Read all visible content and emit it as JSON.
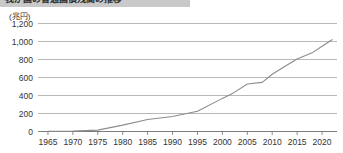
{
  "title": {
    "text": "我が国の普通国債残高の推移"
  },
  "unit": {
    "label": "(兆円)"
  },
  "chart_data": {
    "type": "line",
    "title": "我が国の普通国債残高の推移",
    "xlabel": "",
    "ylabel": "(兆円)",
    "xlim": [
      1963,
      2023
    ],
    "ylim": [
      0,
      1200
    ],
    "grid": true,
    "legend": "none",
    "y_ticks": [
      0,
      200,
      400,
      600,
      800,
      1000,
      1200
    ],
    "y_tick_labels": [
      "0",
      "200",
      "400",
      "600",
      "800",
      "1,000",
      "1,200"
    ],
    "x_ticks": [
      1965,
      1970,
      1975,
      1980,
      1985,
      1990,
      1995,
      2000,
      2005,
      2010,
      2015,
      2020
    ],
    "x_tick_labels": [
      "1965",
      "1970",
      "1975",
      "1980",
      "1985",
      "1990",
      "1995",
      "2000",
      "2005",
      "2010",
      "2015",
      "2020"
    ],
    "series": [
      {
        "name": "普通国債残高",
        "color": "#8c8c8c",
        "x": [
          1965,
          1970,
          1975,
          1980,
          1985,
          1990,
          1995,
          2000,
          2002,
          2005,
          2008,
          2010,
          2012,
          2015,
          2018,
          2020,
          2022
        ],
        "values": [
          2,
          4,
          15,
          71,
          134,
          166,
          225,
          368,
          421,
          527,
          546,
          636,
          705,
          805,
          874,
          947,
          1020
        ]
      }
    ]
  },
  "colors": {
    "line": "#8c8c8c",
    "grid": "#9a9a9a",
    "axis": "#6e6e6e",
    "title_bar": "#c9c9c9",
    "text": "#333333"
  }
}
